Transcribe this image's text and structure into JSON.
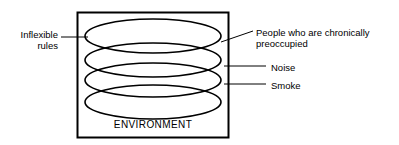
{
  "figure": {
    "type": "concept-diagram",
    "colors": {
      "stroke": "#000000",
      "background": "#ffffff",
      "text": "#000000"
    },
    "container": {
      "name": "environment-box",
      "caption": "ENVIRONMENT"
    },
    "layers": [
      {
        "name": "layer-1",
        "callout": "People who are chronically preoccupied"
      },
      {
        "name": "layer-2",
        "callout": "Noise"
      },
      {
        "name": "layer-3",
        "callout": "Smoke"
      },
      {
        "name": "layer-4",
        "callout": ""
      }
    ],
    "callouts": {
      "left": {
        "label": "Inflexible\nrules",
        "side": "left"
      },
      "right": [
        {
          "label": "People who are chronically\npreoccupied",
          "leader": "diagonal"
        },
        {
          "label": "Noise",
          "leader": "horizontal"
        },
        {
          "label": "Smoke",
          "leader": "horizontal"
        }
      ]
    }
  }
}
